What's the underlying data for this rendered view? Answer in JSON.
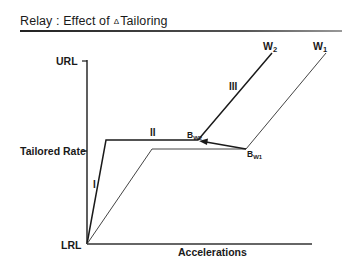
{
  "title": {
    "prefix": "Relay : Effect of",
    "delta_symbol": "Δ",
    "suffix": "Tailoring"
  },
  "axes": {
    "y_labels": {
      "top": "URL",
      "middle": "Tailored Rate",
      "bottom": "LRL"
    },
    "x_label": "Accelerations"
  },
  "segments": {
    "phase_1": "I",
    "phase_2": "II",
    "phase_3": "III"
  },
  "curves": {
    "w2": {
      "label": "W",
      "sub": "2",
      "breakpoint": "B",
      "breakpoint_sub": "W2"
    },
    "w1": {
      "label": "W",
      "sub": "1",
      "breakpoint": "B",
      "breakpoint_sub": "W1"
    }
  },
  "colors": {
    "line": "#1a1a1a",
    "thin_line": "#444444",
    "background": "#ffffff"
  }
}
